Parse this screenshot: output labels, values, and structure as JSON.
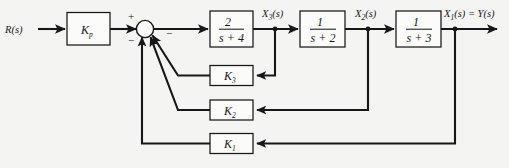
{
  "diagram": {
    "type": "control-block-diagram",
    "background_color": "#f4f4f2",
    "line_color": "#17171a",
    "input": {
      "label": "R(s)",
      "name": "reference-input"
    },
    "output": {
      "label": "X₁(s) = Y(s)",
      "label_main": "X",
      "label_sub": "1",
      "label_rest": "(s) = Y(s)",
      "name": "system-output"
    },
    "summing_junction": {
      "name": "summing-junction",
      "signs": [
        "+",
        "−",
        "−",
        "−"
      ],
      "plus_label": "+",
      "minus_label": "−",
      "input_count": 4
    },
    "forward_blocks": [
      {
        "id": "kp",
        "label": "K",
        "subscript": "p",
        "kind": "gain",
        "name": "gain-block-kp"
      },
      {
        "id": "g1",
        "numerator": "2",
        "denominator": "s + 4",
        "kind": "transfer-function",
        "name": "transfer-function-2-over-s-plus-4"
      },
      {
        "id": "g2",
        "numerator": "1",
        "denominator": "s + 2",
        "kind": "transfer-function",
        "name": "transfer-function-1-over-s-plus-2"
      },
      {
        "id": "g3",
        "numerator": "1",
        "denominator": "s + 3",
        "kind": "transfer-function",
        "name": "transfer-function-1-over-s-plus-3"
      }
    ],
    "intermediate_signals": [
      {
        "id": "x3",
        "label_main": "X",
        "label_sub": "3",
        "label_rest": "(s)",
        "name": "signal-x3"
      },
      {
        "id": "x2",
        "label_main": "X",
        "label_sub": "2",
        "label_rest": "(s)",
        "name": "signal-x2"
      }
    ],
    "feedback_blocks": [
      {
        "id": "k3",
        "label": "K",
        "subscript": "3",
        "source_signal": "X3(s)",
        "name": "feedback-gain-block-k3"
      },
      {
        "id": "k2",
        "label": "K",
        "subscript": "2",
        "source_signal": "X2(s)",
        "name": "feedback-gain-block-k2"
      },
      {
        "id": "k1",
        "label": "K",
        "subscript": "1",
        "source_signal": "X1(s)",
        "name": "feedback-gain-block-k1"
      }
    ]
  }
}
